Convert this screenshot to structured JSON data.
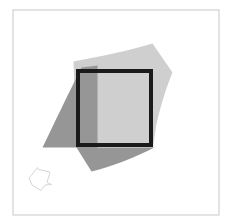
{
  "figure": {
    "title": "Overlapping geometric shapes diagram",
    "background_color": "#ffffff",
    "width": 231,
    "height": 223,
    "frame": {
      "name": "outer-frame",
      "stroke_color": "#c9c9c9",
      "stroke_width": 1,
      "x": 13,
      "y": 10,
      "width": 206,
      "height": 205
    },
    "shapes": [
      {
        "id": "light-gray-quad",
        "label": "Light gray curved quadrilateral",
        "fill_color": "#cfcfcf",
        "opacity": 1,
        "stroke": "none",
        "path": "M 73.5 61.5 C 100 56.5 130 50.5 152.5 43.5 L 172.5 72.5 C 167 85.5 160.5 105.5 156 126.5 L 153 147.5 L 76.5 147.5 Z"
      },
      {
        "id": "dark-gray-quad",
        "label": "Dark gray curved quadrilateral",
        "fill_color": "#969696",
        "opacity": 1,
        "stroke": "none",
        "path": "M 81.5 67.5 L 97.5 65.5 L 97.5 147.5 L 154.5 147.5 C 136 157 112 166.5 91.5 171.5 L 76.5 147.5 L 42.5 147.5 C 54 124 68 94 81.5 67.5 Z"
      },
      {
        "id": "black-square-outline",
        "label": "Bold black square outline",
        "fill_color": "none",
        "stroke_color": "#1a1a1a",
        "stroke_width": 4,
        "x": 78,
        "y": 71,
        "width": 73,
        "height": 74
      },
      {
        "id": "small-polygon-outline",
        "label": "Small faint polygon outline, lower left",
        "fill_color": "none",
        "stroke_color": "#d6d6d6",
        "stroke_width": 1,
        "points": "29,178 37.5,167.5 38.5,169.5 50,172 47,182.5 51.5,184.5 45,185 41,190.5 32,185"
      }
    ]
  }
}
